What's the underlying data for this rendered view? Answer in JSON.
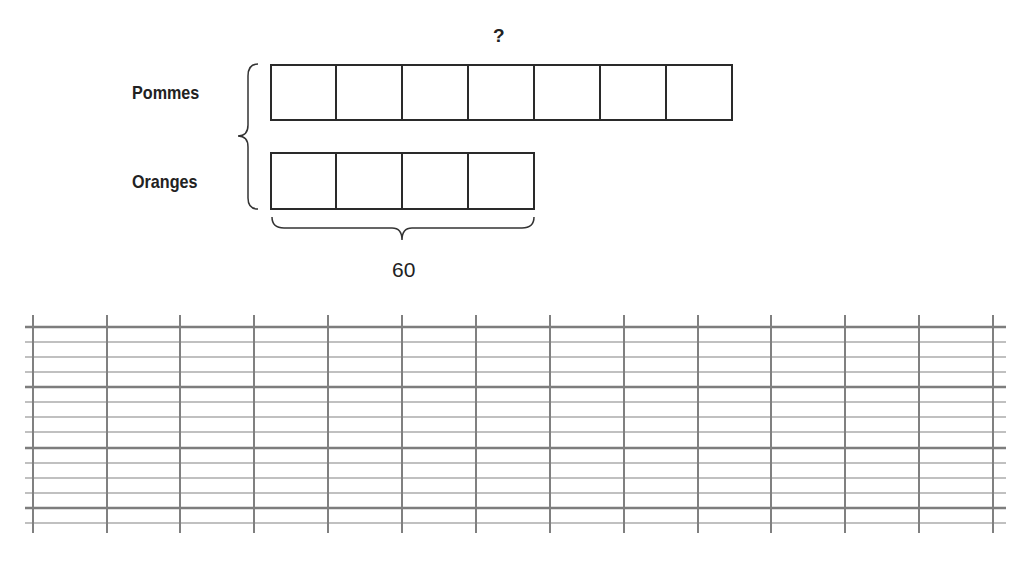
{
  "diagram": {
    "type": "tape-diagram",
    "question_mark": "?",
    "rows": [
      {
        "label": "Pommes",
        "units": 7
      },
      {
        "label": "Oranges",
        "units": 4
      }
    ],
    "oranges_total_label": "60",
    "colors": {
      "stroke": "#2a2a2a",
      "grid_thin": "#a8a8a8",
      "grid_thick": "#7a7a7a"
    }
  },
  "writing_grid": {
    "vertical_lines": 14,
    "horizontal_lines": 14,
    "thick_every": 4
  }
}
